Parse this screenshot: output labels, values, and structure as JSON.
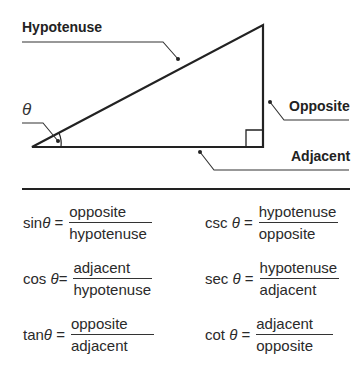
{
  "diagram": {
    "labels": {
      "hypotenuse": "Hypotenuse",
      "opposite": "Opposite",
      "adjacent": "Adjacent",
      "angle": "θ"
    },
    "colors": {
      "line": "#222222",
      "background": "#ffffff"
    }
  },
  "formulas": [
    {
      "fn": "sin",
      "theta": "θ",
      "eq": "=",
      "numerator": "opposite",
      "denominator": "hypotenuse"
    },
    {
      "fn": "csc",
      "theta": "θ",
      "eq": "=",
      "numerator": "hypotenuse",
      "denominator": "opposite"
    },
    {
      "fn": "cos",
      "theta": "θ",
      "eq": "=",
      "numerator": "adjacent",
      "denominator": "hypotenuse"
    },
    {
      "fn": "sec",
      "theta": "θ",
      "eq": "=",
      "numerator": "hypotenuse",
      "denominator": "adjacent"
    },
    {
      "fn": "tan",
      "theta": "θ",
      "eq": "=",
      "numerator": "opposite",
      "denominator": "adjacent"
    },
    {
      "fn": "cot",
      "theta": "θ",
      "eq": "=",
      "numerator": "adjacent",
      "denominator": "opposite"
    }
  ]
}
